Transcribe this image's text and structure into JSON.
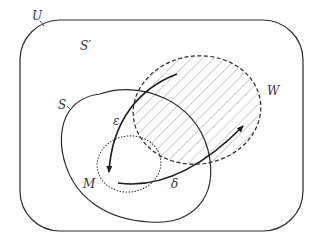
{
  "diagram": {
    "type": "venn-set-diagram",
    "colors": {
      "line": "#2a2a2a",
      "hatch": "#b0b0b0",
      "label": "#333333",
      "background": "#ffffff"
    },
    "sets": [
      {
        "id": "U",
        "label": "U",
        "shape": "rounded-rectangle",
        "stroke": "solid"
      },
      {
        "id": "S_complement",
        "label": "S′",
        "shape": "region"
      },
      {
        "id": "S",
        "label": "S",
        "shape": "ellipse",
        "stroke": "solid"
      },
      {
        "id": "W",
        "label": "W",
        "shape": "ellipse",
        "stroke": "dashed",
        "fill": "hatched"
      },
      {
        "id": "M",
        "label": "M",
        "shape": "ellipse",
        "stroke": "dotted"
      }
    ],
    "arrows": [
      {
        "id": "epsilon",
        "label": "ε",
        "from": "W",
        "to": "M"
      },
      {
        "id": "delta",
        "label": "δ",
        "from": "M",
        "to": "W"
      }
    ]
  },
  "labels": {
    "U": "U",
    "S_prime": "S′",
    "S": "S",
    "W": "W",
    "M": "M",
    "epsilon": "ε",
    "delta": "δ"
  }
}
